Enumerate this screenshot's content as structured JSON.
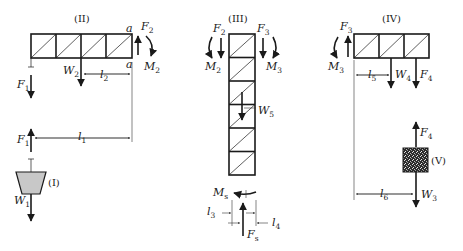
{
  "figure": {
    "colors": {
      "ink": "#1a1a1a",
      "bucket_fill": "#c8c8c8",
      "block_fill": "#555555"
    }
  },
  "components": {
    "I": {
      "label": "(I)",
      "kind": "bucket",
      "forces": {
        "up": "F",
        "up_sub": "1",
        "down": "W",
        "down_sub": "1"
      }
    },
    "II": {
      "label": "(II)",
      "kind": "horizontal-truss",
      "panels": 4,
      "point_top": "a",
      "point_bottom": "a",
      "forces": {
        "F1": {
          "base": "F",
          "sub": "1"
        },
        "W2": {
          "base": "W",
          "sub": "2"
        },
        "F2": {
          "base": "F",
          "sub": "2"
        },
        "M2": {
          "base": "M",
          "sub": "2"
        }
      },
      "dims": {
        "l1": {
          "base": "l",
          "sub": "1"
        },
        "l2": {
          "base": "l",
          "sub": "2"
        }
      }
    },
    "III": {
      "label": "(III)",
      "kind": "vertical-truss",
      "panels": 6,
      "forces": {
        "F2": {
          "base": "F",
          "sub": "2"
        },
        "M2": {
          "base": "M",
          "sub": "2"
        },
        "F3": {
          "base": "F",
          "sub": "3"
        },
        "M3": {
          "base": "M",
          "sub": "3"
        },
        "W5": {
          "base": "W",
          "sub": "5"
        },
        "Fs": {
          "base": "F",
          "sub": "s"
        },
        "Ms": {
          "base": "M",
          "sub": "s"
        }
      },
      "dims": {
        "l3": {
          "base": "l",
          "sub": "3"
        },
        "l4": {
          "base": "l",
          "sub": "4"
        }
      }
    },
    "IV": {
      "label": "(IV)",
      "kind": "horizontal-truss",
      "panels": 3,
      "forces": {
        "F3": {
          "base": "F",
          "sub": "3"
        },
        "M3": {
          "base": "M",
          "sub": "3"
        },
        "W4": {
          "base": "W",
          "sub": "4"
        },
        "F4": {
          "base": "F",
          "sub": "4"
        }
      },
      "dims": {
        "l5": {
          "base": "l",
          "sub": "5"
        },
        "l6": {
          "base": "l",
          "sub": "6"
        }
      }
    },
    "V": {
      "label": "(V)",
      "kind": "counterweight-block",
      "forces": {
        "up": "F",
        "up_sub": "4",
        "down": "W",
        "down_sub": "3"
      }
    }
  }
}
